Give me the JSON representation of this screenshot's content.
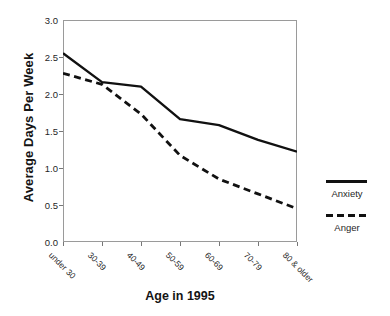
{
  "chart_data": {
    "type": "line",
    "title": "",
    "xlabel": "Age in 1995",
    "ylabel": "Average Days Per Week",
    "categories": [
      "under 30",
      "30-39",
      "40-49",
      "50-59",
      "60-69",
      "70-79",
      "80 & older"
    ],
    "ylim": [
      0.0,
      3.0
    ],
    "yticks": [
      "0.0",
      "0.5",
      "1.0",
      "1.5",
      "2.0",
      "2.5",
      "3.0"
    ],
    "ytick_values": [
      0.0,
      0.5,
      1.0,
      1.5,
      2.0,
      2.5,
      3.0
    ],
    "grid": false,
    "legend_position": "right",
    "series": [
      {
        "name": "Anxiety",
        "style": "solid",
        "color": "#111111",
        "values": [
          2.55,
          2.16,
          2.1,
          1.66,
          1.58,
          1.38,
          1.22
        ]
      },
      {
        "name": "Anger",
        "style": "dashed",
        "color": "#111111",
        "values": [
          2.28,
          2.13,
          1.73,
          1.17,
          0.85,
          0.65,
          0.45
        ]
      }
    ]
  },
  "legend": {
    "entries": [
      {
        "label": "Anxiety",
        "style": "solid"
      },
      {
        "label": "Anger",
        "style": "dashed"
      }
    ]
  },
  "colors": {
    "line": "#111111",
    "axis": "#9a9a9a",
    "text": "#1a1a1a",
    "background": "#ffffff"
  }
}
